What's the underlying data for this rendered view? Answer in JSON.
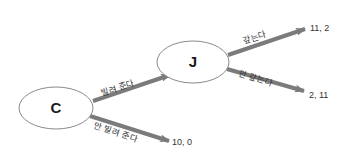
{
  "diagram": {
    "type": "game-tree",
    "colors": {
      "arrow": "#7b7b7b",
      "node_fill": "#ffffff",
      "node_stroke": "#8a8a8a",
      "text": "#222222"
    },
    "nodes": [
      {
        "id": "C",
        "label": "C"
      },
      {
        "id": "J",
        "label": "J"
      }
    ],
    "edges": [
      {
        "from": "C",
        "to": "J",
        "label": "빌려 준다"
      },
      {
        "from": "C",
        "to": "payoff_c_no",
        "label": "안 빌려 준다"
      },
      {
        "from": "J",
        "to": "payoff_j_repay",
        "label": "갚는다"
      },
      {
        "from": "J",
        "to": "payoff_j_norepay",
        "label": "안 갚는다"
      }
    ],
    "payoffs": {
      "c_no_lend": "10, 0",
      "j_repay": "11, 2",
      "j_no_repay": "2, 11"
    }
  }
}
